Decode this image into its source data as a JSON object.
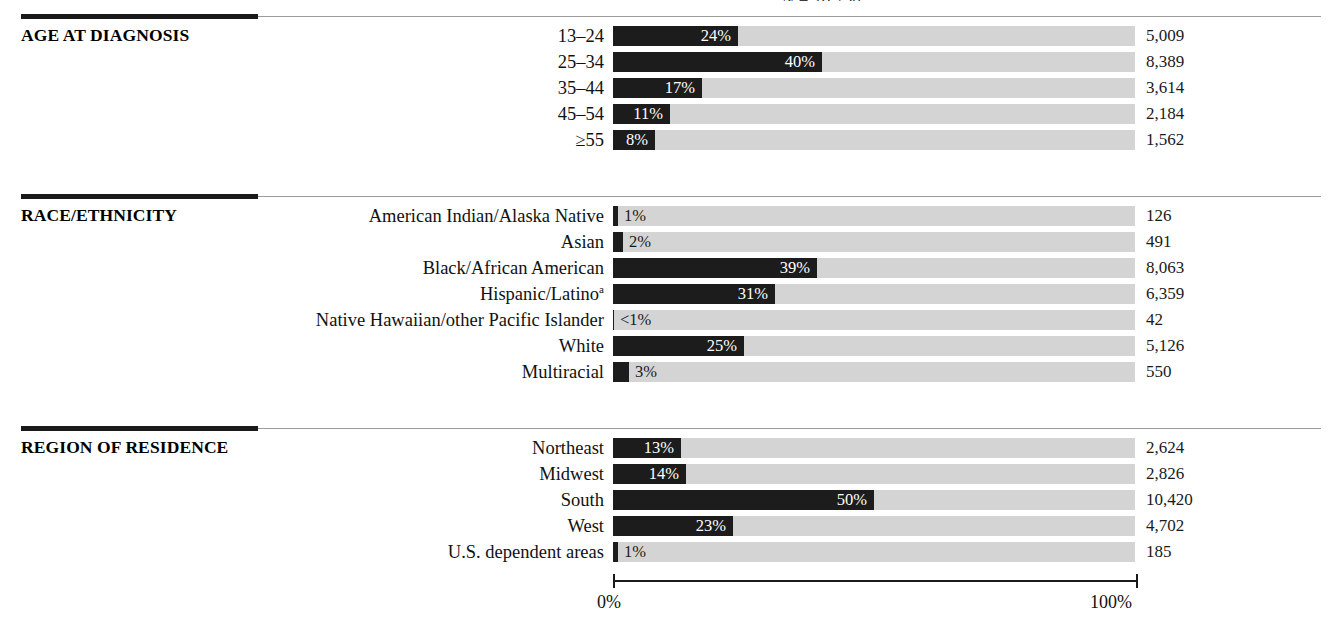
{
  "figure": {
    "top_caption": "N = 20,758",
    "axis": {
      "min_label": "0%",
      "max_label": "100%",
      "min_value": 0,
      "max_value": 100
    },
    "colors": {
      "bar_fill": "#1c1c1c",
      "track_fill": "#d4d4d4",
      "rule_accent": "#1a1a1a",
      "rule_line": "#9b9b9b",
      "text": "#111111",
      "bar_value_text": "#ffffff"
    },
    "sections": [
      {
        "title": "AGE AT DIAGNOSIS",
        "rows": [
          {
            "label": "13–24",
            "percent_label": "24%",
            "percent": 24,
            "count": "5,009",
            "count_value": 5009,
            "inside": true
          },
          {
            "label": "25–34",
            "percent_label": "40%",
            "percent": 40,
            "count": "8,389",
            "count_value": 8389,
            "inside": true
          },
          {
            "label": "35–44",
            "percent_label": "17%",
            "percent": 17,
            "count": "3,614",
            "count_value": 3614,
            "inside": true
          },
          {
            "label": "45–54",
            "percent_label": "11%",
            "percent": 11,
            "count": "2,184",
            "count_value": 2184,
            "inside": true
          },
          {
            "label": "≥55",
            "percent_label": "8%",
            "percent": 8,
            "count": "1,562",
            "count_value": 1562,
            "inside": true
          }
        ]
      },
      {
        "title": "RACE/ETHNICITY",
        "rows": [
          {
            "label": "American Indian/Alaska Native",
            "percent_label": "1%",
            "percent": 1,
            "count": "126",
            "count_value": 126,
            "inside": false
          },
          {
            "label": "Asian",
            "percent_label": "2%",
            "percent": 2,
            "count": "491",
            "count_value": 491,
            "inside": false
          },
          {
            "label": "Black/African American",
            "percent_label": "39%",
            "percent": 39,
            "count": "8,063",
            "count_value": 8063,
            "inside": true
          },
          {
            "label": "Hispanic/Latino",
            "label_sup": "a",
            "percent_label": "31%",
            "percent": 31,
            "count": "6,359",
            "count_value": 6359,
            "inside": true
          },
          {
            "label": "Native Hawaiian/other Pacific Islander",
            "percent_label": "<1%",
            "percent": 0.2,
            "count": "42",
            "count_value": 42,
            "inside": false
          },
          {
            "label": "White",
            "percent_label": "25%",
            "percent": 25,
            "count": "5,126",
            "count_value": 5126,
            "inside": true
          },
          {
            "label": "Multiracial",
            "percent_label": "3%",
            "percent": 3,
            "count": "550",
            "count_value": 550,
            "inside": false
          }
        ]
      },
      {
        "title": "REGION OF RESIDENCE",
        "rows": [
          {
            "label": "Northeast",
            "percent_label": "13%",
            "percent": 13,
            "count": "2,624",
            "count_value": 2624,
            "inside": true
          },
          {
            "label": "Midwest",
            "percent_label": "14%",
            "percent": 14,
            "count": "2,826",
            "count_value": 2826,
            "inside": true
          },
          {
            "label": "South",
            "percent_label": "50%",
            "percent": 50,
            "count": "10,420",
            "count_value": 10420,
            "inside": true
          },
          {
            "label": "West",
            "percent_label": "23%",
            "percent": 23,
            "count": "4,702",
            "count_value": 4702,
            "inside": true
          },
          {
            "label": "U.S. dependent areas",
            "percent_label": "1%",
            "percent": 1,
            "count": "185",
            "count_value": 185,
            "inside": false
          }
        ]
      }
    ]
  },
  "chart_data": {
    "type": "bar",
    "orientation": "horizontal",
    "title": "",
    "annotation": "N = 20,758",
    "xlabel": "",
    "ylabel": "",
    "xlim": [
      0,
      100
    ],
    "xticks": [
      0,
      100
    ],
    "xticklabels": [
      "0%",
      "100%"
    ],
    "grid": false,
    "legend": null,
    "groups": [
      {
        "name": "AGE AT DIAGNOSIS",
        "categories": [
          "13–24",
          "25–34",
          "35–44",
          "45–54",
          "≥55"
        ],
        "values": [
          24,
          40,
          17,
          11,
          8
        ],
        "value_labels": [
          "24%",
          "40%",
          "17%",
          "11%",
          "8%"
        ],
        "counts": [
          5009,
          8389,
          3614,
          2184,
          1562
        ],
        "count_labels": [
          "5,009",
          "8,389",
          "3,614",
          "2,184",
          "1,562"
        ]
      },
      {
        "name": "RACE/ETHNICITY",
        "categories": [
          "American Indian/Alaska Native",
          "Asian",
          "Black/African American",
          "Hispanic/Latino",
          "Native Hawaiian/other Pacific Islander",
          "White",
          "Multiracial"
        ],
        "values": [
          1,
          2,
          39,
          31,
          0.2,
          25,
          3
        ],
        "value_labels": [
          "1%",
          "2%",
          "39%",
          "31%",
          "<1%",
          "25%",
          "3%"
        ],
        "counts": [
          126,
          491,
          8063,
          6359,
          42,
          5126,
          550
        ],
        "count_labels": [
          "126",
          "491",
          "8,063",
          "6,359",
          "42",
          "5,126",
          "550"
        ]
      },
      {
        "name": "REGION OF RESIDENCE",
        "categories": [
          "Northeast",
          "Midwest",
          "South",
          "West",
          "U.S. dependent areas"
        ],
        "values": [
          13,
          14,
          50,
          23,
          1
        ],
        "value_labels": [
          "13%",
          "14%",
          "50%",
          "23%",
          "1%"
        ],
        "counts": [
          2624,
          2826,
          10420,
          4702,
          185
        ],
        "count_labels": [
          "2,624",
          "2,826",
          "10,420",
          "4,702",
          "185"
        ]
      }
    ]
  }
}
